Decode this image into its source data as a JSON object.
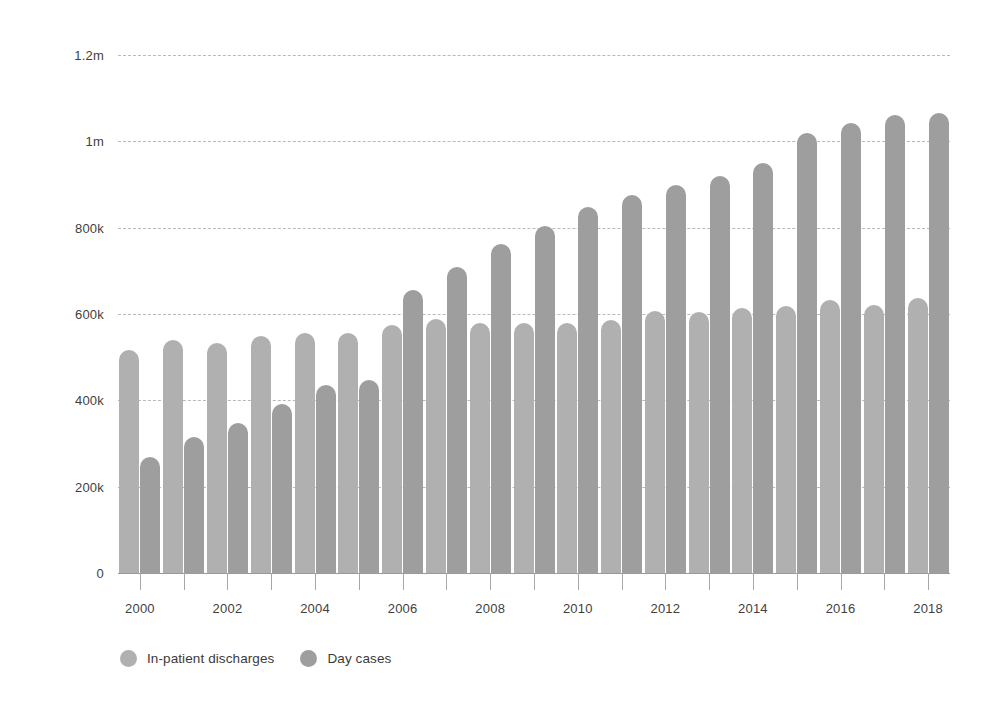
{
  "chart_data": {
    "type": "bar",
    "title": "",
    "subtitle": "",
    "xlabel": "",
    "ylabel": "",
    "grid": true,
    "legend_position": "bottom-left",
    "ylim": [
      0,
      1200000
    ],
    "y_ticks": [
      0,
      200000,
      400000,
      600000,
      800000,
      1000000,
      1200000
    ],
    "y_tick_labels": [
      "0",
      "200k",
      "400k",
      "600k",
      "800k",
      "1m",
      "1.2m"
    ],
    "categories": [
      "2000",
      "2001",
      "2002",
      "2003",
      "2004",
      "2005",
      "2006",
      "2007",
      "2008",
      "2009",
      "2010",
      "2011",
      "2012",
      "2013",
      "2014",
      "2015",
      "2016",
      "2017",
      "2018"
    ],
    "x_tick_labels": [
      "2000",
      "2002",
      "2004",
      "2006",
      "2008",
      "2010",
      "2012",
      "2014",
      "2016",
      "2018"
    ],
    "series": [
      {
        "name": "In-patient discharges",
        "color": "#b0b0b0",
        "values": [
          517000,
          540000,
          533000,
          550000,
          557000,
          555000,
          575000,
          588000,
          580000,
          580000,
          580000,
          585000,
          608000,
          605000,
          615000,
          618000,
          632000,
          620000,
          637000
        ]
      },
      {
        "name": "Day cases",
        "color": "#9e9e9e",
        "values": [
          269000,
          315000,
          348000,
          392000,
          435000,
          447000,
          655000,
          710000,
          762000,
          805000,
          848000,
          875000,
          900000,
          920000,
          950000,
          1020000,
          1042000,
          1062000,
          1066000
        ]
      }
    ]
  },
  "legend": {
    "items": [
      {
        "label": "In-patient discharges",
        "color": "#b0b0b0",
        "swatch_name": "legend-swatch-inpatient"
      },
      {
        "label": "Day cases",
        "color": "#9e9e9e",
        "swatch_name": "legend-swatch-daycases"
      }
    ]
  }
}
